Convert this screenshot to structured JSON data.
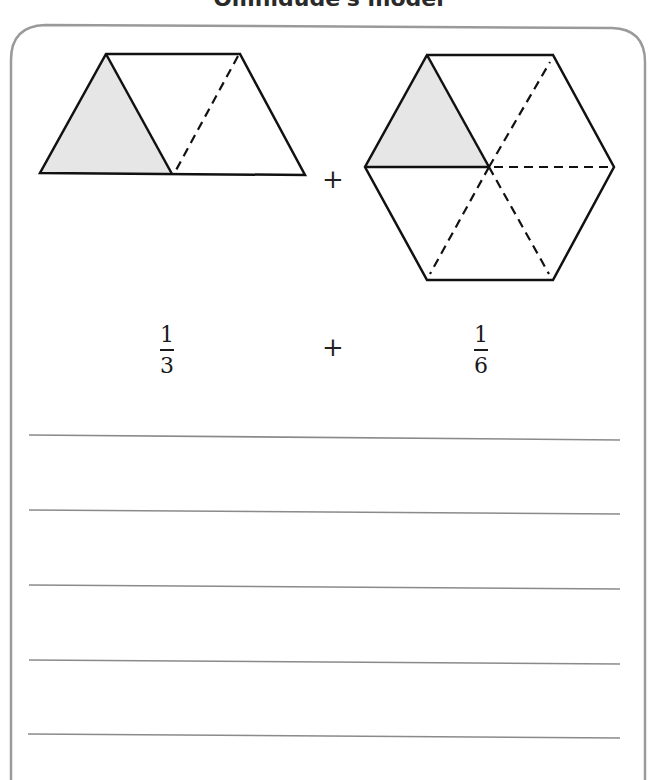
{
  "title": "Omnidude's model",
  "model": {
    "shape_left": {
      "name": "trapezoid",
      "parts": 3,
      "shaded": 1
    },
    "operator_between_shapes": "+",
    "shape_right": {
      "name": "hexagon",
      "parts": 6,
      "shaded": 1
    }
  },
  "fractions": [
    {
      "numerator": "1",
      "denominator": "3"
    },
    {
      "operator": "+"
    },
    {
      "numerator": "1",
      "denominator": "6"
    }
  ],
  "answer_lines": 5,
  "colors": {
    "shade": "#e6e6e6",
    "stroke": "#111111",
    "frame": "#9a9a9a",
    "rule": "#8a8a8a"
  }
}
